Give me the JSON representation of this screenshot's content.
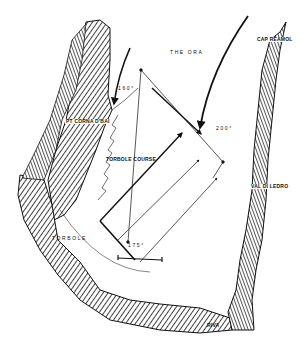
{
  "map": {
    "wind": {
      "name": "THE ORA"
    },
    "places": {
      "pt_corna": "PT CORNA D'BAI",
      "cap_reamol": "CAP REAMOL",
      "val_di_ledro": "VAL DI LEDRO",
      "torbole": "TORBOLE",
      "riva": "RIVA"
    },
    "course": {
      "name": "TORBOLE COURSE"
    },
    "bearings": {
      "b160": "160°",
      "b200": "200°",
      "b175": "175°"
    },
    "colors": {
      "ink": "#111111",
      "paper": "#ffffff"
    }
  }
}
